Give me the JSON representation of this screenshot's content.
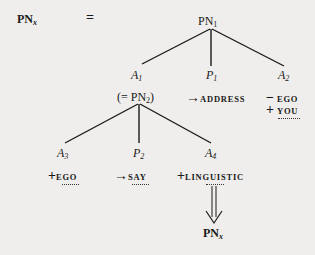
{
  "diagram": {
    "lhs": {
      "base": "PN",
      "sub": "x"
    },
    "equals": "=",
    "root": {
      "base": "PN",
      "sub": "1"
    },
    "level1": [
      {
        "base": "A",
        "sub": "1"
      },
      {
        "base": "P",
        "sub": "1"
      },
      {
        "base": "A",
        "sub": "2"
      }
    ],
    "a1_value": {
      "prefix": "(= ",
      "base": "PN",
      "sub": "2",
      "suffix": ")"
    },
    "p1_value": {
      "op": "→",
      "word": "ADDRESS"
    },
    "a2_values": [
      {
        "op": "−",
        "word": "EGO"
      },
      {
        "op": "+",
        "word": "YOU"
      }
    ],
    "level2": [
      {
        "base": "A",
        "sub": "3"
      },
      {
        "base": "P",
        "sub": "2"
      },
      {
        "base": "A",
        "sub": "4"
      }
    ],
    "a3_value": {
      "op": "+",
      "word": "EGO"
    },
    "p2_value": {
      "op": "→",
      "word": "SAY"
    },
    "a4_value": {
      "op": "+",
      "word": "LINGUISTIC"
    },
    "result": {
      "base": "PN",
      "sub": "x"
    },
    "colors": {
      "background": "#efeeec",
      "ink": "#1a1a1a"
    }
  }
}
